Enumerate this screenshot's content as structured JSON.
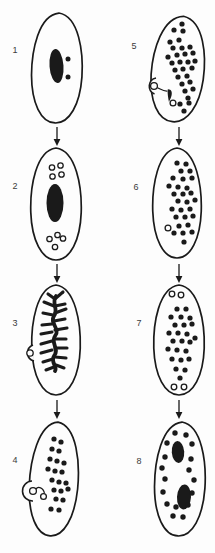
{
  "figure": {
    "ink_color": "#1a1a1a",
    "paper_color": "#fdfdfd",
    "label_color": "#3b3b3b",
    "stages": [
      {
        "number": "1",
        "label_xy": [
          9,
          45
        ],
        "cell": {
          "cx": 57,
          "cy": 68,
          "rx": 26,
          "ry": 55,
          "tilt": 2
        },
        "macronuclei": [
          {
            "cx": 56.5,
            "cy": 66,
            "rx": 7,
            "ry": 17,
            "tilt": -4
          }
        ],
        "dot_r": 2.5,
        "dots": [
          [
            68,
            59
          ],
          [
            68,
            77
          ]
        ],
        "micronuclei": [],
        "bump": null,
        "branch": null,
        "teardrop": null,
        "connectors": []
      },
      {
        "number": "2",
        "label_xy": [
          9,
          181
        ],
        "cell": {
          "cx": 56,
          "cy": 204,
          "rx": 26,
          "ry": 56,
          "tilt": 0
        },
        "macronuclei": [
          {
            "cx": 55,
            "cy": 203,
            "rx": 8.5,
            "ry": 19,
            "tilt": 0
          }
        ],
        "dot_r": 2.6,
        "dots": [],
        "micronuclei": [
          [
            52,
            167.5,
            2.7
          ],
          [
            60.5,
            165.5,
            2.7
          ],
          [
            52.5,
            176.5,
            2.7
          ],
          [
            61.5,
            174.5,
            2.7
          ],
          [
            49.5,
            239,
            2.7
          ],
          [
            57.5,
            235,
            2.7
          ],
          [
            63,
            238.5,
            2.7
          ],
          [
            55,
            247,
            2.7
          ]
        ],
        "bump": null,
        "branch": null,
        "teardrop": null,
        "connectors": []
      },
      {
        "number": "3",
        "label_xy": [
          9,
          318
        ],
        "cell": {
          "cx": 56,
          "cy": 340,
          "rx": 25,
          "ry": 55,
          "tilt": 0
        },
        "macronuclei": [],
        "dot_r": 2.6,
        "dots": [],
        "micronuclei": [
          [
            30,
            353,
            3.2
          ]
        ],
        "bump": {
          "ax": 33,
          "ay": 345,
          "bx": 34,
          "by": 361,
          "r": 8.4
        },
        "branch": {
          "spine": "M56,296 C51,303 59,309 54,316 C49,323 61,329 55,336 C50,343 60,349 54,356 C50,362 58,367 55,371",
          "segments": [
            [
              56,
              298,
              63,
              292
            ],
            [
              55,
              299,
              48,
              294
            ],
            [
              54,
              306,
              44,
              302
            ],
            [
              55,
              306,
              65,
              304
            ],
            [
              55,
              313,
              66,
              309
            ],
            [
              53,
              315,
              43,
              313
            ],
            [
              54,
              321,
              65,
              319
            ],
            [
              52,
              324,
              42,
              325
            ],
            [
              55,
              330,
              67,
              328
            ],
            [
              52,
              332,
              41,
              334
            ],
            [
              54,
              339,
              66,
              339
            ],
            [
              52,
              341,
              41,
              344
            ],
            [
              55,
              348,
              67,
              348
            ],
            [
              52,
              350,
              41,
              353
            ],
            [
              55,
              357,
              66,
              358
            ],
            [
              53,
              359,
              43,
              362
            ],
            [
              56,
              365,
              64,
              368
            ],
            [
              54,
              367,
              46,
              370
            ]
          ]
        },
        "teardrop": null,
        "connectors": []
      },
      {
        "number": "4",
        "label_xy": [
          9,
          455
        ],
        "cell": {
          "cx": 54,
          "cy": 479,
          "rx": 25,
          "ry": 57,
          "tilt": 4
        },
        "macronuclei": [],
        "dot_r": 2.6,
        "dots": [
          [
            54,
            439
          ],
          [
            61,
            442
          ],
          [
            52,
            449
          ],
          [
            59,
            451
          ],
          [
            50,
            459
          ],
          [
            57,
            461
          ],
          [
            64,
            463
          ],
          [
            48,
            469
          ],
          [
            55,
            471
          ],
          [
            62,
            472
          ],
          [
            52,
            480
          ],
          [
            59,
            482
          ],
          [
            66,
            483
          ],
          [
            54,
            490
          ],
          [
            61,
            491
          ],
          [
            68,
            489
          ],
          [
            56,
            499
          ],
          [
            63,
            500
          ],
          [
            51,
            509
          ],
          [
            59,
            510
          ]
        ],
        "micronuclei": [
          [
            33,
            491,
            3.4
          ],
          [
            43.5,
            496.5,
            2.9
          ]
        ],
        "bump": {
          "ax": 32,
          "ay": 481,
          "bx": 33,
          "by": 501,
          "r": 10
        },
        "branch": null,
        "teardrop": null,
        "connectors": [
          "M35.8,489.2 C38,485.8 43.5,487.5 44.5,493.5"
        ]
      },
      {
        "number": "5",
        "label_xy": [
          128,
          41
        ],
        "cell": {
          "cx": 178,
          "cy": 69,
          "rx": 27,
          "ry": 53,
          "tilt": 6
        },
        "macronuclei": [],
        "dot_r": 2.6,
        "dots": [
          [
            182,
            24
          ],
          [
            174,
            30
          ],
          [
            183,
            31
          ],
          [
            170,
            42
          ],
          [
            179,
            40
          ],
          [
            173,
            48
          ],
          [
            182,
            48
          ],
          [
            190,
            47
          ],
          [
            168,
            57
          ],
          [
            177,
            55
          ],
          [
            185,
            54
          ],
          [
            193,
            53
          ],
          [
            172,
            63
          ],
          [
            180,
            62
          ],
          [
            188,
            62
          ],
          [
            195,
            61
          ],
          [
            175,
            70
          ],
          [
            183,
            69
          ],
          [
            192,
            68
          ],
          [
            178,
            77
          ],
          [
            187,
            76
          ],
          [
            182,
            84
          ],
          [
            190,
            82
          ],
          [
            185,
            91
          ],
          [
            193,
            89
          ],
          [
            188,
            98
          ],
          [
            180,
            104
          ],
          [
            189,
            103
          ],
          [
            184,
            111
          ]
        ],
        "micronuclei": [
          [
            154,
            86,
            3.4
          ],
          [
            173,
            103,
            2.9
          ]
        ],
        "bump": {
          "ax": 156,
          "ay": 78,
          "bx": 154.5,
          "by": 94,
          "r": 8.4
        },
        "branch": null,
        "teardrop": "M167.8,89.2 C171.2,89 172.4,92 171.6,95.2 C171,97.8 169.8,100.4 168.9,101.8 C168.3,98.4 167.2,93.4 167.8,89.2 Z",
        "connectors": [
          "M157.2,87.5 C161.5,89.5 163.5,91.5 167.5,91"
        ]
      },
      {
        "number": "6",
        "label_xy": [
          130,
          182
        ],
        "cell": {
          "cx": 177,
          "cy": 203,
          "rx": 25,
          "ry": 55,
          "tilt": 0
        },
        "macronuclei": [],
        "dot_r": 2.6,
        "dots": [
          [
            177,
            163
          ],
          [
            186,
            164
          ],
          [
            181,
            171
          ],
          [
            190,
            171
          ],
          [
            173,
            178
          ],
          [
            183,
            179
          ],
          [
            192,
            178
          ],
          [
            169,
            186
          ],
          [
            178,
            187
          ],
          [
            187,
            188
          ],
          [
            174,
            194
          ],
          [
            183,
            194
          ],
          [
            191,
            193
          ],
          [
            178,
            201
          ],
          [
            187,
            202
          ],
          [
            195,
            200
          ],
          [
            172,
            209
          ],
          [
            181,
            210
          ],
          [
            190,
            209
          ],
          [
            176,
            217
          ],
          [
            185,
            217
          ],
          [
            193,
            216
          ],
          [
            179,
            226
          ],
          [
            188,
            225
          ],
          [
            174,
            233
          ],
          [
            183,
            233
          ],
          [
            192,
            232
          ],
          [
            184,
            242
          ]
        ],
        "micronuclei": [
          [
            168,
            228,
            2.9
          ]
        ],
        "bump": null,
        "branch": null,
        "teardrop": null,
        "connectors": []
      },
      {
        "number": "7",
        "label_xy": [
          133,
          318
        ],
        "cell": {
          "cx": 179,
          "cy": 340,
          "rx": 26,
          "ry": 55,
          "tilt": 0
        },
        "macronuclei": [],
        "dot_r": 2.6,
        "dots": [
          [
            177,
            309
          ],
          [
            186,
            309
          ],
          [
            171,
            317
          ],
          [
            181,
            317
          ],
          [
            190,
            318
          ],
          [
            175,
            325
          ],
          [
            184,
            325
          ],
          [
            192,
            324
          ],
          [
            169,
            333
          ],
          [
            178,
            333
          ],
          [
            187,
            334
          ],
          [
            173,
            341
          ],
          [
            182,
            341
          ],
          [
            190,
            342
          ],
          [
            195,
            338
          ],
          [
            168,
            349
          ],
          [
            177,
            350
          ],
          [
            186,
            351
          ],
          [
            172,
            359
          ],
          [
            181,
            360
          ],
          [
            189,
            359
          ],
          [
            176,
            369
          ],
          [
            185,
            370
          ],
          [
            180,
            378
          ]
        ],
        "micronuclei": [
          [
            172,
            294,
            2.8
          ],
          [
            181,
            295,
            2.8
          ],
          [
            174,
            387,
            2.8
          ],
          [
            184,
            387,
            2.8
          ]
        ],
        "bump": null,
        "branch": null,
        "teardrop": null,
        "connectors": []
      },
      {
        "number": "8",
        "label_xy": [
          133,
          456
        ],
        "cell": {
          "cx": 180,
          "cy": 479,
          "rx": 26,
          "ry": 57,
          "tilt": 2
        },
        "macronuclei": [
          {
            "cx": 178,
            "cy": 452,
            "rx": 6.2,
            "ry": 11,
            "tilt": -4
          },
          {
            "cx": 184,
            "cy": 497,
            "rx": 7,
            "ry": 12.5,
            "tilt": 3
          }
        ],
        "dot_r": 2.7,
        "dots": [
          [
            175,
            433
          ],
          [
            186,
            435
          ],
          [
            167,
            443
          ],
          [
            192,
            444
          ],
          [
            165,
            457
          ],
          [
            191,
            459
          ],
          [
            162,
            468
          ],
          [
            189,
            470
          ],
          [
            165,
            479
          ],
          [
            194,
            480
          ],
          [
            163,
            492
          ],
          [
            192,
            493
          ],
          [
            167,
            504
          ],
          [
            188,
            505
          ],
          [
            176,
            507
          ],
          [
            173,
            516
          ],
          [
            183,
            517
          ]
        ],
        "micronuclei": [],
        "bump": null,
        "branch": null,
        "teardrop": null,
        "connectors": []
      }
    ],
    "arrows": [
      {
        "x": 57,
        "y1": 127,
        "y2": 146
      },
      {
        "x": 179,
        "y1": 127,
        "y2": 146
      },
      {
        "x": 57,
        "y1": 264,
        "y2": 283
      },
      {
        "x": 179,
        "y1": 264,
        "y2": 283
      },
      {
        "x": 57,
        "y1": 400,
        "y2": 419
      },
      {
        "x": 179,
        "y1": 400,
        "y2": 419
      }
    ]
  }
}
